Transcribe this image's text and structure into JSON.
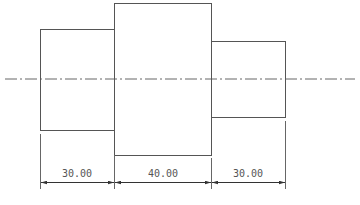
{
  "drawing": {
    "type": "stepped shaft side view",
    "line_color": "#555555",
    "centerline": {
      "y": 79,
      "x_start": 5,
      "x_end": 355,
      "style": "dash-dot"
    },
    "segments": [
      {
        "name": "left-segment",
        "x": 40,
        "y": 29,
        "w": 74,
        "h": 101
      },
      {
        "name": "middle-segment",
        "x": 114,
        "y": 3,
        "w": 97,
        "h": 152
      },
      {
        "name": "right-segment",
        "x": 211,
        "y": 41,
        "w": 74,
        "h": 76
      }
    ],
    "dimensions": [
      {
        "label": "30.00",
        "x1": 40,
        "x2": 114
      },
      {
        "label": "40.00",
        "x1": 114,
        "x2": 211
      },
      {
        "label": "30.00",
        "x1": 211,
        "x2": 285
      }
    ]
  }
}
